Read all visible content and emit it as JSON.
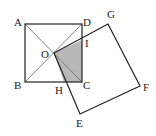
{
  "diagram": {
    "points": {
      "A": {
        "label": "A",
        "x": 25,
        "y": 24
      },
      "B": {
        "label": "B",
        "x": 25,
        "y": 82
      },
      "C": {
        "label": "C",
        "x": 82,
        "y": 82
      },
      "D": {
        "label": "D",
        "x": 82,
        "y": 24
      },
      "O": {
        "label": "O",
        "x": 54,
        "y": 53
      },
      "G": {
        "label": "G",
        "x": 108,
        "y": 24
      },
      "F": {
        "label": "F",
        "x": 140,
        "y": 86
      },
      "E": {
        "label": "E",
        "x": 80,
        "y": 114
      },
      "I": {
        "label": "I",
        "x": 82,
        "y": 40
      },
      "H": {
        "label": "H",
        "x": 64,
        "y": 82
      }
    },
    "shaded_region": "OICH",
    "colors": {
      "stroke": "#222222",
      "shade": "#b8b8b8",
      "diagonal": "#666666"
    }
  }
}
